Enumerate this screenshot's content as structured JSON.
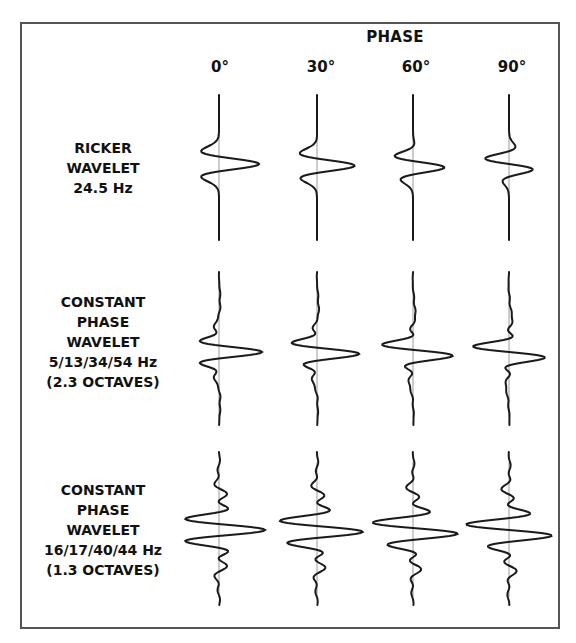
{
  "header": {
    "title": "PHASE",
    "phases": [
      "0°",
      "30°",
      "60°",
      "90°"
    ]
  },
  "rows": [
    {
      "lines": [
        "RICKER",
        "WAVELET",
        "24.5 Hz"
      ]
    },
    {
      "lines": [
        "CONSTANT",
        "PHASE",
        "WAVELET",
        "5/13/34/54 Hz",
        "(2.3 OCTAVES)"
      ]
    },
    {
      "lines": [
        "CONSTANT",
        "PHASE",
        "WAVELET",
        "16/17/40/44 Hz",
        "(1.3 OCTAVES)"
      ]
    }
  ],
  "colors": {
    "trace": "#1a1a1a",
    "axis": "#9a9a9a",
    "frame": "#555555",
    "background": "#ffffff"
  }
}
